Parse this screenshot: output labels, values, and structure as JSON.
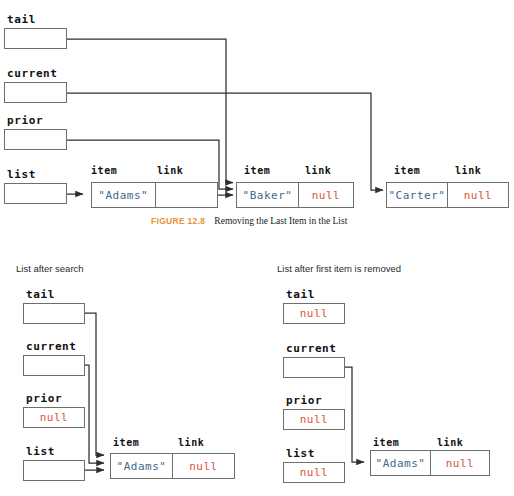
{
  "figure": {
    "number": "FIGURE 12.8",
    "title": "Removing the Last Item in the List"
  },
  "colors": {
    "string_value": "#44688c",
    "null_value": "#d9533c",
    "figure_number": "#e8913a",
    "line": "#3a3a3a",
    "box_border": "#6e6e6e"
  },
  "top_diagram": {
    "pointers": [
      {
        "label": "tail",
        "value": "",
        "has_dot": true
      },
      {
        "label": "current",
        "value": "",
        "has_dot": true
      },
      {
        "label": "prior",
        "value": "",
        "has_dot": true
      },
      {
        "label": "list",
        "value": "",
        "has_dot": true
      }
    ],
    "nodes": [
      {
        "item_header": "item",
        "link_header": "link",
        "item_value": "\"Adams\"",
        "link_value": "",
        "link_is_null": false,
        "link_has_dot": true
      },
      {
        "item_header": "item",
        "link_header": "link",
        "item_value": "\"Baker\"",
        "link_value": "null",
        "link_is_null": true,
        "link_has_dot": false
      },
      {
        "item_header": "item",
        "link_header": "link",
        "item_value": "\"Carter\"",
        "link_value": "null",
        "link_is_null": true,
        "link_has_dot": false
      }
    ]
  },
  "bottom_left_panel": {
    "caption": "List after search",
    "pointers": [
      {
        "label": "tail",
        "value": "",
        "has_dot": true,
        "is_null": false
      },
      {
        "label": "current",
        "value": "",
        "has_dot": true,
        "is_null": false
      },
      {
        "label": "prior",
        "value": "null",
        "has_dot": false,
        "is_null": true
      },
      {
        "label": "list",
        "value": "",
        "has_dot": true,
        "is_null": false
      }
    ],
    "node": {
      "item_header": "item",
      "link_header": "link",
      "item_value": "\"Adams\"",
      "link_value": "null",
      "link_is_null": true
    }
  },
  "bottom_right_panel": {
    "caption": "List after first item is removed",
    "pointers": [
      {
        "label": "tail",
        "value": "null",
        "has_dot": false,
        "is_null": true
      },
      {
        "label": "current",
        "value": "",
        "has_dot": true,
        "is_null": false
      },
      {
        "label": "prior",
        "value": "null",
        "has_dot": false,
        "is_null": true
      },
      {
        "label": "list",
        "value": "null",
        "has_dot": false,
        "is_null": true
      }
    ],
    "node": {
      "item_header": "item",
      "link_header": "link",
      "item_value": "\"Adams\"",
      "link_value": "null",
      "link_is_null": true
    }
  }
}
